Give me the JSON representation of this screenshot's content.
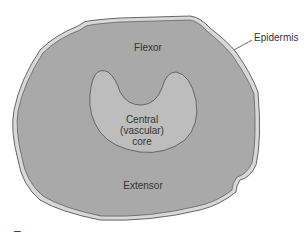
{
  "diagram": {
    "labels": {
      "flexor": "Flexor",
      "central_line1": "Central",
      "central_line2": "(vascular)",
      "central_line3": "core",
      "extensor": "Extensor",
      "epidermis": "Epidermis"
    },
    "colors": {
      "outer_fill": "#a9a9a9",
      "core_fill": "#bdbdbd",
      "epidermis_fill": "#d8d8d8",
      "outline": "#444444"
    },
    "corner_mark": "–"
  }
}
